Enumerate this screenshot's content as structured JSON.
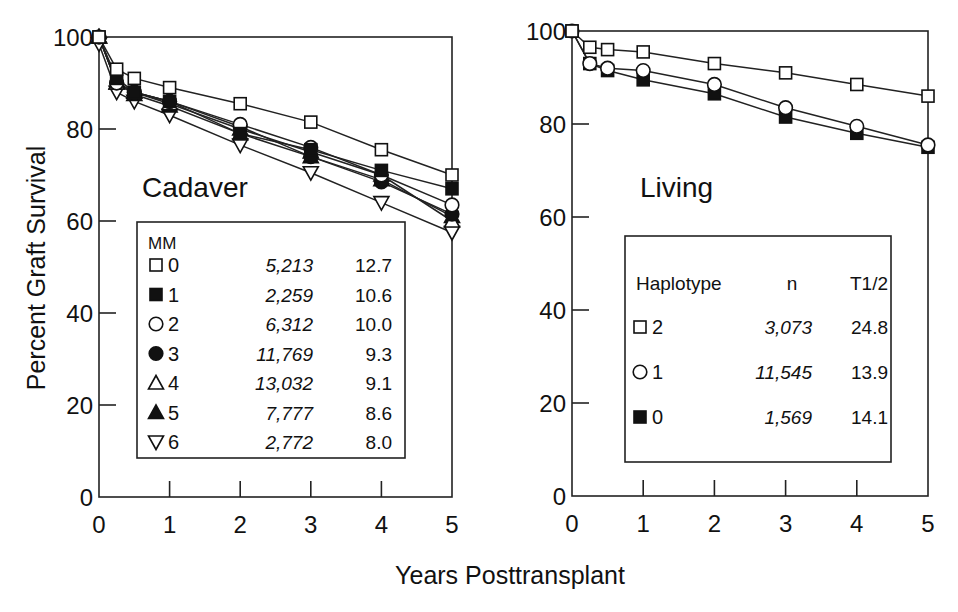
{
  "figure": {
    "ylabel": "Percent Graft Survival",
    "xlabel": "Years Posttransplant"
  },
  "chart_data": [
    {
      "type": "line",
      "title": "Cadaver",
      "xlabel": "Years Posttransplant",
      "ylabel": "Percent Graft Survival",
      "xlim": [
        0,
        5
      ],
      "ylim": [
        0,
        100
      ],
      "xticks": [
        "0",
        "1",
        "2",
        "3",
        "4",
        "5"
      ],
      "yticks": [
        "0",
        "20",
        "40",
        "60",
        "80",
        "100"
      ],
      "grid": false,
      "legend": {
        "header": "MM",
        "position": "inside-lower",
        "columns": [
          "MM",
          "n",
          "T1/2"
        ]
      },
      "x": [
        0,
        0.25,
        0.5,
        1,
        2,
        3,
        4,
        5
      ],
      "series": [
        {
          "name": "0",
          "marker": "open-square",
          "n": "5,213",
          "t_half": "12.7",
          "values": [
            100,
            93,
            91,
            89,
            85.5,
            81.5,
            75.5,
            70
          ]
        },
        {
          "name": "1",
          "marker": "filled-square",
          "n": "2,259",
          "t_half": "10.6",
          "values": [
            100,
            91,
            88,
            86,
            79,
            75.5,
            71,
            67
          ]
        },
        {
          "name": "2",
          "marker": "open-circle",
          "n": "6,312",
          "t_half": "10.0",
          "values": [
            100,
            90,
            88,
            86,
            81,
            76,
            70,
            63.5
          ]
        },
        {
          "name": "3",
          "marker": "filled-circle",
          "n": "11,769",
          "t_half": "9.3",
          "values": [
            100,
            90,
            88,
            86,
            80.5,
            74,
            68.5,
            61.5
          ]
        },
        {
          "name": "4",
          "marker": "open-triangle-up",
          "n": "13,032",
          "t_half": "9.1",
          "values": [
            100,
            90,
            88,
            85.5,
            80,
            75,
            70,
            60
          ]
        },
        {
          "name": "5",
          "marker": "filled-triangle-up",
          "n": "7,777",
          "t_half": "8.6",
          "values": [
            100,
            90,
            87.5,
            85,
            79,
            74,
            69,
            61
          ]
        },
        {
          "name": "6",
          "marker": "open-triangle-down",
          "n": "2,772",
          "t_half": "8.0",
          "values": [
            98.5,
            88,
            86,
            83,
            76.5,
            70.5,
            64,
            57.5
          ]
        }
      ]
    },
    {
      "type": "line",
      "title": "Living",
      "xlabel": "Years Posttransplant",
      "ylabel": "Percent Graft Survival",
      "xlim": [
        0,
        5
      ],
      "ylim": [
        0,
        100
      ],
      "xticks": [
        "0",
        "1",
        "2",
        "3",
        "4",
        "5"
      ],
      "yticks": [
        "0",
        "20",
        "40",
        "60",
        "80",
        "100"
      ],
      "grid": false,
      "legend": {
        "header": "Haplotype",
        "position": "inside-lower",
        "columns": [
          "Haplotype",
          "n",
          "T1/2"
        ]
      },
      "x": [
        0,
        0.25,
        0.5,
        1,
        2,
        3,
        4,
        5
      ],
      "series": [
        {
          "name": "2",
          "marker": "open-square",
          "n": "3,073",
          "t_half": "24.8",
          "values": [
            100,
            96.5,
            96,
            95.5,
            93,
            91,
            88.5,
            86
          ]
        },
        {
          "name": "1",
          "marker": "open-circle",
          "n": "11,545",
          "t_half": "13.9",
          "values": [
            100,
            93,
            92,
            91.5,
            88.5,
            83.5,
            79.5,
            75.5
          ]
        },
        {
          "name": "0",
          "marker": "filled-square",
          "n": "1,569",
          "t_half": "14.1",
          "values": [
            100,
            93,
            91.5,
            89.5,
            86.5,
            81.5,
            78,
            75
          ]
        }
      ]
    }
  ]
}
